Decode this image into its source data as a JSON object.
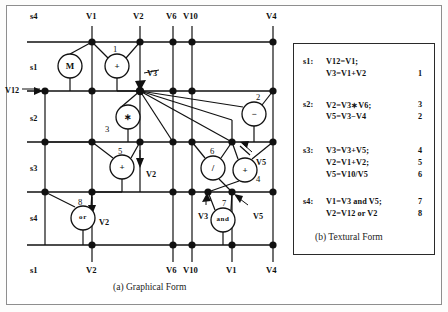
{
  "figure": {
    "graph_caption": "(a) Graphical Form",
    "text_caption": "(b) Textural Form"
  },
  "graph": {
    "top_labels": [
      {
        "text": "s4",
        "x": 30,
        "y": 11
      },
      {
        "text": "V1",
        "x": 86,
        "y": 11
      },
      {
        "text": "V2",
        "x": 133,
        "y": 11
      },
      {
        "text": "V6",
        "x": 166,
        "y": 11
      },
      {
        "text": "V10",
        "x": 183,
        "y": 11
      },
      {
        "text": "V4",
        "x": 266,
        "y": 11
      }
    ],
    "bottom_labels": [
      {
        "text": "s1",
        "x": 30,
        "y": 265
      },
      {
        "text": "V2",
        "x": 86,
        "y": 265
      },
      {
        "text": "V6",
        "x": 166,
        "y": 265
      },
      {
        "text": "V10",
        "x": 183,
        "y": 265
      },
      {
        "text": "V1",
        "x": 226,
        "y": 265
      },
      {
        "text": "V4",
        "x": 266,
        "y": 265
      }
    ],
    "row_labels": [
      {
        "text": "s1",
        "x": 30,
        "y": 63
      },
      {
        "text": "s2",
        "x": 30,
        "y": 114
      },
      {
        "text": "s3",
        "x": 30,
        "y": 164
      },
      {
        "text": "s4",
        "x": 30,
        "y": 214
      }
    ],
    "port_labels": [
      {
        "text": "V12",
        "x": 5,
        "y": 86
      },
      {
        "text": "V3",
        "x": 147,
        "y": 69
      },
      {
        "text": "V2",
        "x": 146,
        "y": 170
      },
      {
        "text": "V5",
        "x": 256,
        "y": 158
      },
      {
        "text": "V2",
        "x": 99,
        "y": 218
      },
      {
        "text": "V3",
        "x": 198,
        "y": 212
      },
      {
        "text": "V5",
        "x": 253,
        "y": 212
      }
    ],
    "operations": [
      {
        "id": "move",
        "glyph": "M",
        "num": "",
        "cx": 70,
        "cy": 66,
        "r": 12
      },
      {
        "id": "op1",
        "glyph": "+",
        "num": "1",
        "cx": 117,
        "cy": 66,
        "r": 12,
        "nx": 113,
        "ny": 44
      },
      {
        "id": "op3",
        "glyph": "∗",
        "num": "3",
        "cx": 128,
        "cy": 117,
        "r": 12,
        "nx": 105,
        "ny": 124
      },
      {
        "id": "op2",
        "glyph": "−",
        "num": "2",
        "cx": 254,
        "cy": 114,
        "r": 12,
        "nx": 256,
        "ny": 92
      },
      {
        "id": "op5",
        "glyph": "+",
        "num": "5",
        "cx": 122,
        "cy": 167,
        "r": 12,
        "nx": 118,
        "ny": 146
      },
      {
        "id": "op6",
        "glyph": "/",
        "num": "6",
        "cx": 213,
        "cy": 168,
        "r": 12,
        "nx": 210,
        "ny": 146
      },
      {
        "id": "op4",
        "glyph": "+",
        "num": "4",
        "cx": 245,
        "cy": 170,
        "r": 12,
        "nx": 256,
        "ny": 174
      },
      {
        "id": "op8",
        "glyph": "or",
        "num": "8",
        "cx": 83,
        "cy": 218,
        "r": 12,
        "nx": 78,
        "ny": 197
      },
      {
        "id": "op7",
        "glyph": "and",
        "num": "7",
        "cx": 223,
        "cy": 220,
        "r": 12,
        "nx": 222,
        "ny": 198
      }
    ]
  },
  "textual": {
    "blocks": [
      {
        "label": "s1:",
        "y": 56,
        "lines": [
          {
            "code": "V12=V1;",
            "num": "",
            "dy": 0
          },
          {
            "code": "V3=V1+V2",
            "num": "1",
            "dy": 12
          }
        ]
      },
      {
        "label": "s2:",
        "y": 99,
        "lines": [
          {
            "code": "V2=V3∗V6;",
            "num": "3",
            "dy": 0
          },
          {
            "code": "V5=V3−V4",
            "num": "2",
            "dy": 12
          }
        ]
      },
      {
        "label": "s3:",
        "y": 145,
        "lines": [
          {
            "code": "V3=V3+V5;",
            "num": "4",
            "dy": 0
          },
          {
            "code": "V2=V1+V2;",
            "num": "5",
            "dy": 12
          },
          {
            "code": "V5=V10/V5",
            "num": "6",
            "dy": 24
          }
        ]
      },
      {
        "label": "s4:",
        "y": 196,
        "lines": [
          {
            "code": "V1=V3 and V5;",
            "num": "7",
            "dy": 0
          },
          {
            "code": "V2=V12 or V2",
            "num": "8",
            "dy": 12
          }
        ]
      }
    ]
  },
  "colors": {
    "ink": "#111111",
    "frame": "#8e8e8e",
    "paper": "#ffffff"
  }
}
